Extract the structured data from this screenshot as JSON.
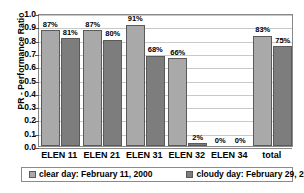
{
  "chart_data": {
    "type": "bar",
    "title": "",
    "xlabel": "",
    "ylabel": "PR - Performance Ratio",
    "ylim": [
      0.0,
      1.0
    ],
    "ytick_labels": [
      "1.0",
      "0.9",
      "0.8",
      "0.7",
      "0.6",
      "0.5",
      "0.4",
      "0.3",
      "0.2",
      "0.1",
      "0.0"
    ],
    "ytick_values": [
      1.0,
      0.9,
      0.8,
      0.7,
      0.6,
      0.5,
      0.4,
      0.3,
      0.2,
      0.1,
      0.0
    ],
    "grid": true,
    "legend_position": "bottom",
    "categories": [
      "ELEN 11",
      "ELEN 21",
      "ELEN 31",
      "ELEN 32",
      "ELEN 34",
      "total"
    ],
    "series": [
      {
        "name": "clear day: February 11, 2000",
        "color": "#a9a9a9",
        "values": [
          0.87,
          0.87,
          0.91,
          0.66,
          0.0,
          0.83
        ],
        "data_labels": [
          "87%",
          "87%",
          "91%",
          "66%",
          "0%",
          "83%"
        ]
      },
      {
        "name": "cloudy day: February 29, 2000",
        "color": "#7d7d7d",
        "values": [
          0.81,
          0.8,
          0.68,
          0.02,
          0.0,
          0.75
        ],
        "data_labels": [
          "81%",
          "80%",
          "68%",
          "2%",
          "0%",
          "75%"
        ]
      }
    ]
  },
  "legend": {
    "entries": [
      {
        "label": "clear day: February 11, 2000"
      },
      {
        "label": "cloudy day: February 29, 2000"
      }
    ]
  }
}
